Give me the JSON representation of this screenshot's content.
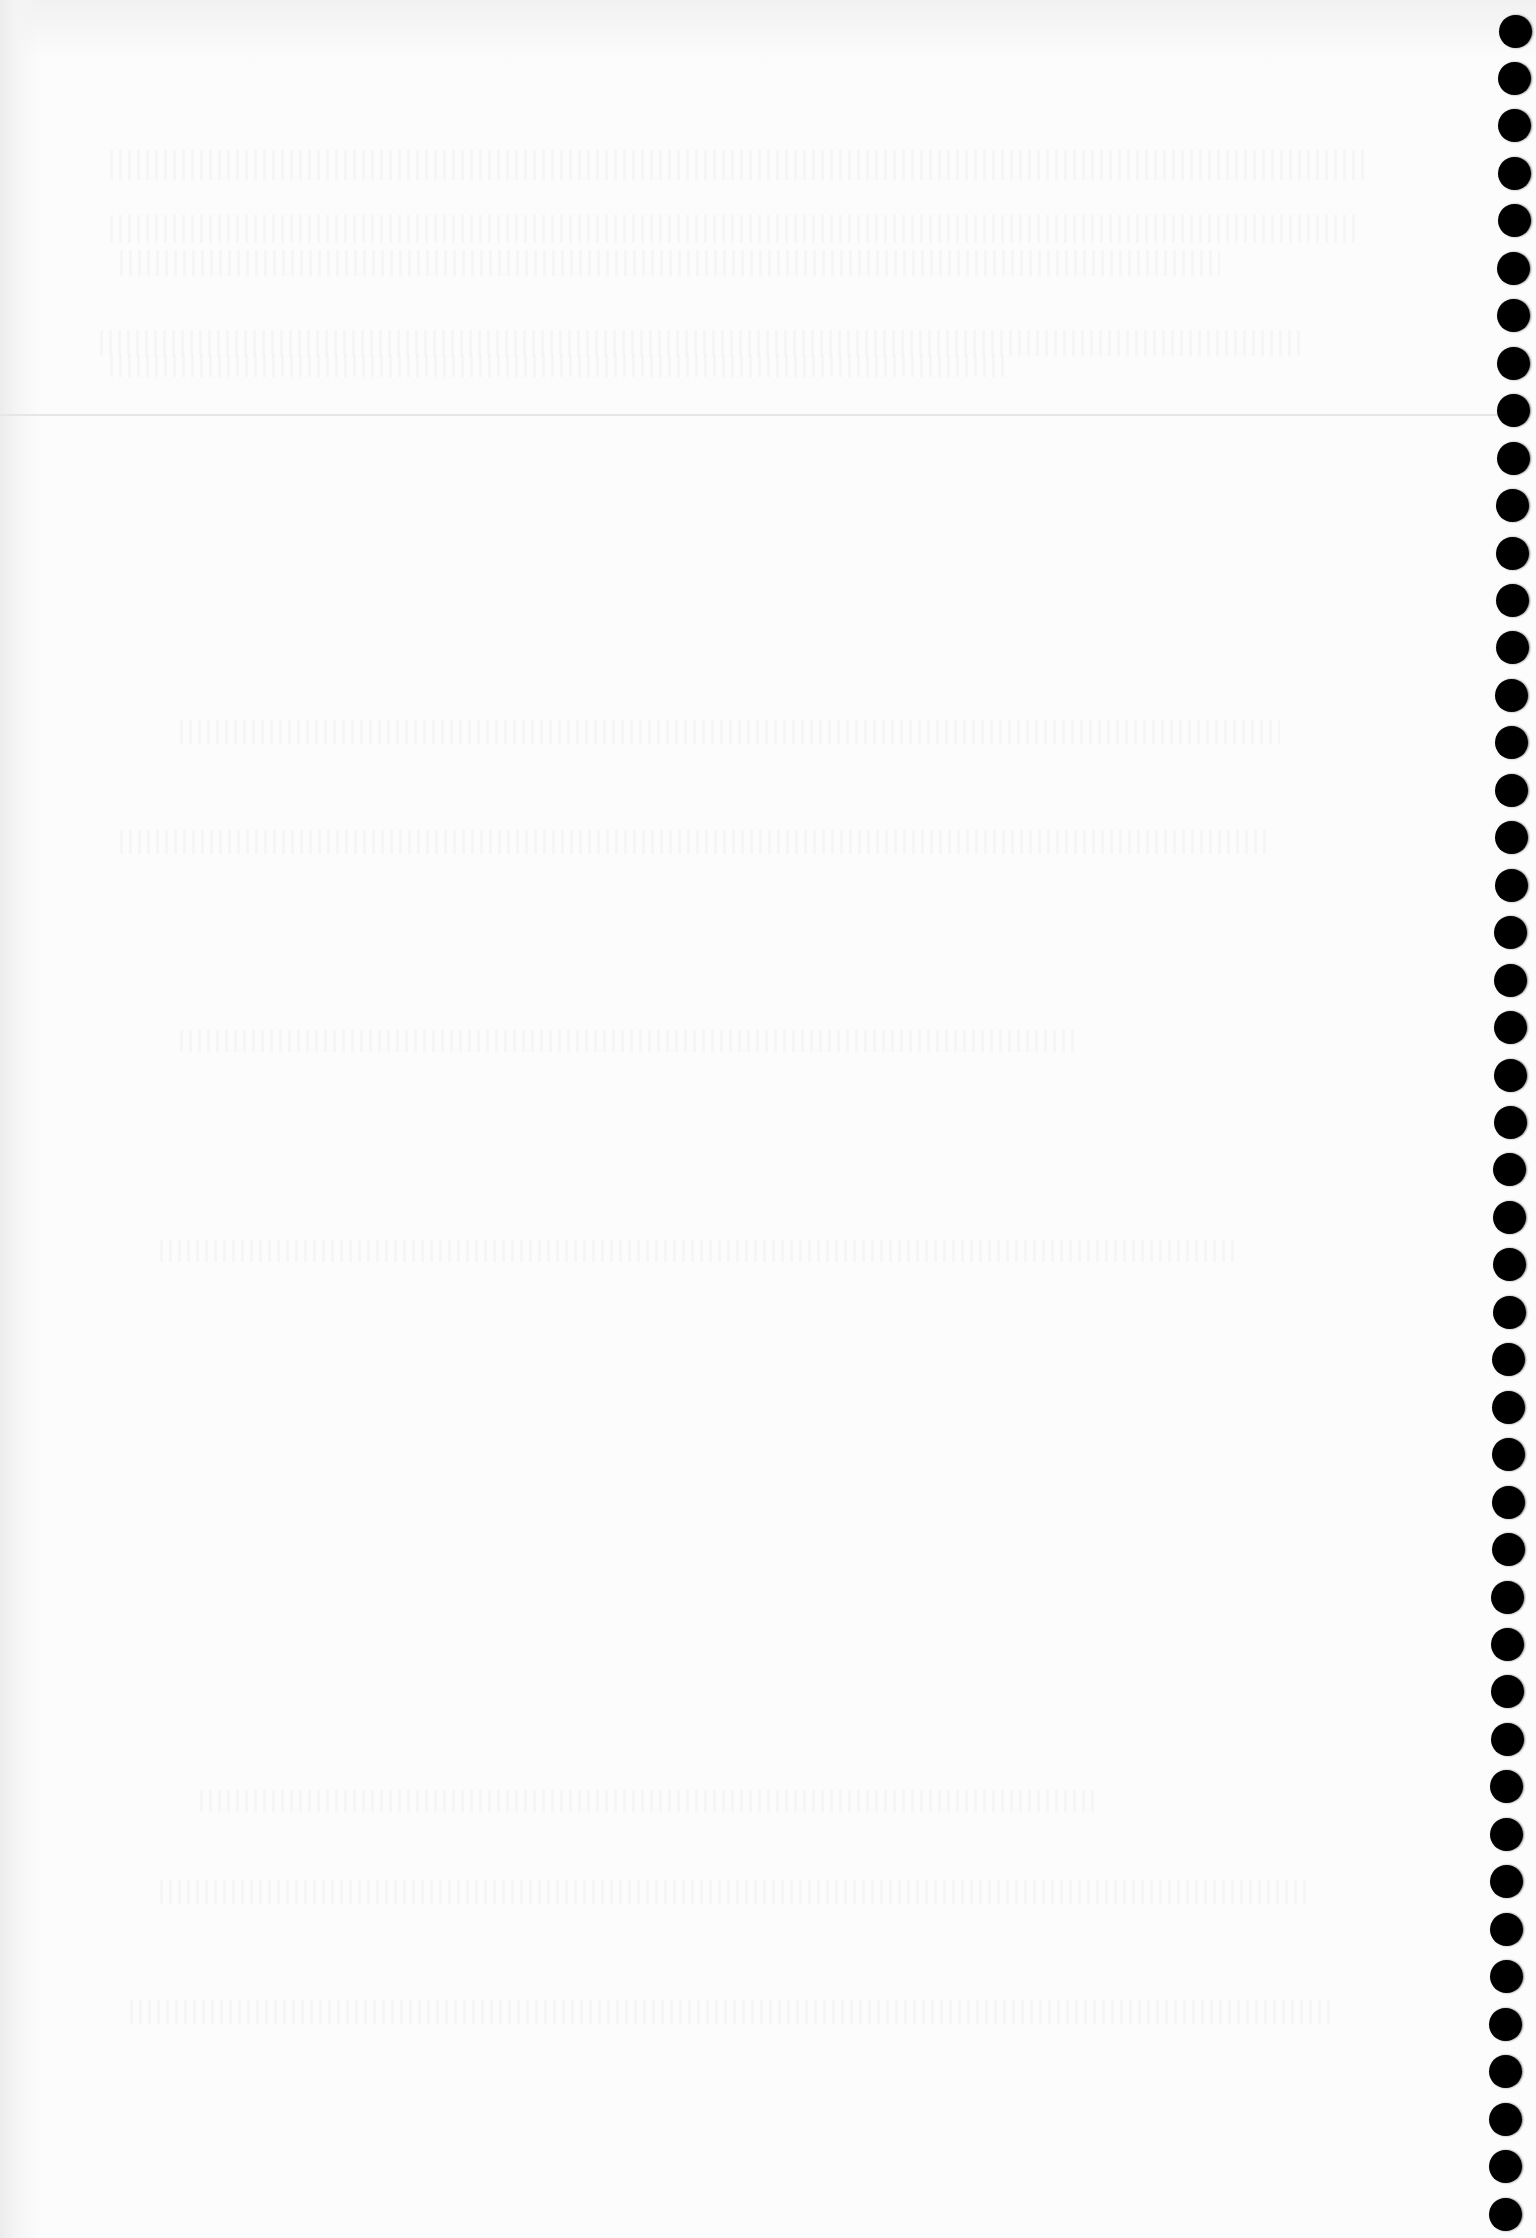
{
  "page": {
    "type": "blank-notebook-page",
    "width": 1536,
    "height": 2238,
    "paper_color": "#fcfcfc",
    "text": ""
  },
  "rule_line": {
    "y": 414,
    "color": "#e6e6e6"
  },
  "binding_holes": {
    "count": 47,
    "diameter": 33,
    "color": "#000000",
    "first_center": {
      "x": 1515,
      "y": 31
    },
    "last_center": {
      "x": 1505,
      "y": 2214
    },
    "pitch": 47.45
  },
  "bleed_bands": [
    {
      "x": 110,
      "y": 150,
      "w": 1260,
      "h": 30
    },
    {
      "x": 110,
      "y": 215,
      "w": 1250,
      "h": 28
    },
    {
      "x": 120,
      "y": 250,
      "w": 1100,
      "h": 26
    },
    {
      "x": 100,
      "y": 330,
      "w": 1200,
      "h": 26
    },
    {
      "x": 110,
      "y": 355,
      "w": 900,
      "h": 22
    },
    {
      "x": 180,
      "y": 720,
      "w": 1100,
      "h": 24
    },
    {
      "x": 120,
      "y": 830,
      "w": 1150,
      "h": 24
    },
    {
      "x": 180,
      "y": 1030,
      "w": 900,
      "h": 22
    },
    {
      "x": 160,
      "y": 1240,
      "w": 1080,
      "h": 22
    },
    {
      "x": 200,
      "y": 1790,
      "w": 900,
      "h": 22
    },
    {
      "x": 160,
      "y": 1880,
      "w": 1150,
      "h": 24
    },
    {
      "x": 130,
      "y": 2000,
      "w": 1200,
      "h": 24
    }
  ]
}
